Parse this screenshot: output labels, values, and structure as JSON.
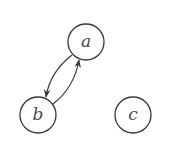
{
  "graph": {
    "nodes": [
      {
        "id": "a",
        "label": "a",
        "cx": 86,
        "cy": 42,
        "r": 18
      },
      {
        "id": "b",
        "label": "b",
        "cx": 38,
        "cy": 115,
        "r": 18
      },
      {
        "id": "c",
        "label": "c",
        "cx": 133,
        "cy": 115,
        "r": 18
      }
    ],
    "edges": [
      {
        "from": "a",
        "to": "b",
        "directed": true
      },
      {
        "from": "b",
        "to": "a",
        "directed": true
      }
    ]
  },
  "colors": {
    "stroke": "#3a3a3a",
    "label": "#4a4a4a",
    "background": "#ffffff"
  }
}
